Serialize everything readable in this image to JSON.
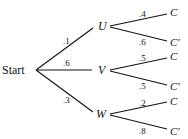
{
  "diagram": {
    "type": "probability-tree",
    "root": {
      "label": "Start"
    },
    "level1": [
      {
        "label": "U",
        "prob": ".1"
      },
      {
        "label": "V",
        "prob": ".6"
      },
      {
        "label": "W",
        "prob": ".3"
      }
    ],
    "level2": {
      "U": [
        {
          "label": "C",
          "prob": ".4"
        },
        {
          "label": "C′",
          "prob": ".6"
        }
      ],
      "V": [
        {
          "label": "C",
          "prob": ".5"
        },
        {
          "label": "C′",
          "prob": ".5"
        }
      ],
      "W": [
        {
          "label": "C",
          "prob": ".2"
        },
        {
          "label": "C′",
          "prob": ".8"
        }
      ]
    },
    "line_color": "#111111"
  }
}
